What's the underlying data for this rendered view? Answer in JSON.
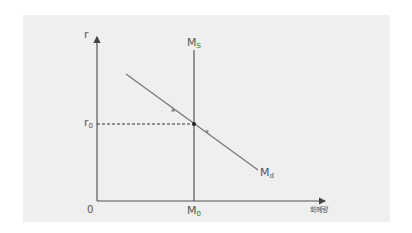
{
  "diagram": {
    "type": "money-market-equilibrium",
    "y_axis": {
      "label": "r"
    },
    "x_axis": {
      "label": "화폐량",
      "origin_label": "0"
    },
    "supply_curve": {
      "label_main": "M",
      "label_sub": "S"
    },
    "demand_curve": {
      "label_main": "M",
      "label_sub": "d"
    },
    "equilibrium": {
      "rate_label_main": "r",
      "rate_label_sub": "0",
      "quantity_label_main": "M",
      "quantity_label_sub": "0"
    },
    "colors": {
      "axis": "#555555",
      "curve": "#707070",
      "background": "#efefef"
    }
  }
}
